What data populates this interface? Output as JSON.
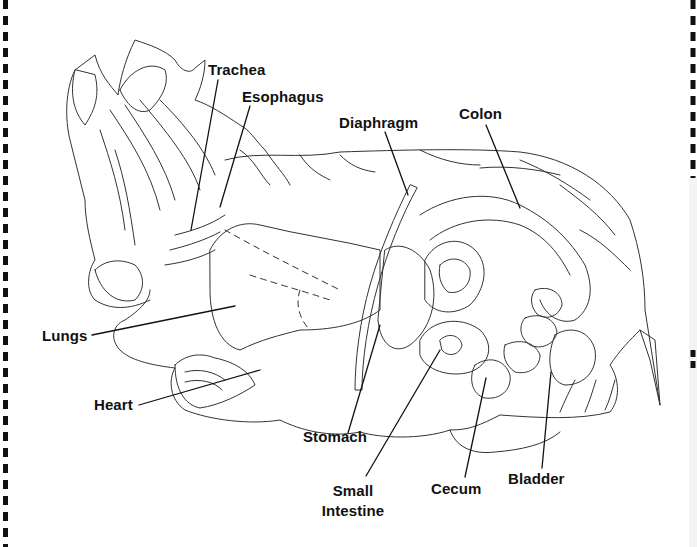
{
  "diagram": {
    "labels": [
      {
        "id": "trachea",
        "text": "Trachea"
      },
      {
        "id": "esophagus",
        "text": "Esophagus"
      },
      {
        "id": "diaphragm",
        "text": "Diaphragm"
      },
      {
        "id": "colon",
        "text": "Colon"
      },
      {
        "id": "lungs",
        "text": "Lungs"
      },
      {
        "id": "heart",
        "text": "Heart"
      },
      {
        "id": "stomach",
        "text": "Stomach"
      },
      {
        "id": "small_intestine_1",
        "text": "Small"
      },
      {
        "id": "small_intestine_2",
        "text": "Intestine"
      },
      {
        "id": "cecum",
        "text": "Cecum"
      },
      {
        "id": "bladder",
        "text": "Bladder"
      }
    ],
    "colors": {
      "line": "#333333",
      "label": "#111111",
      "background": "#ffffff",
      "border_dash": "#111111"
    }
  }
}
